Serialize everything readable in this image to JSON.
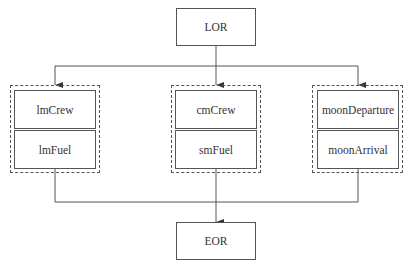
{
  "diagram": {
    "top_node": {
      "label": "LOR"
    },
    "bottom_node": {
      "label": "EOR"
    },
    "groups": [
      {
        "nodes": [
          {
            "label": "lmCrew"
          },
          {
            "label": "lmFuel"
          }
        ]
      },
      {
        "nodes": [
          {
            "label": "cmCrew"
          },
          {
            "label": "smFuel"
          }
        ]
      },
      {
        "nodes": [
          {
            "label": "moonDeparture"
          },
          {
            "label": "moonArrival"
          }
        ]
      }
    ],
    "edges": [
      {
        "from": "LOR",
        "to": "group-1"
      },
      {
        "from": "LOR",
        "to": "group-2"
      },
      {
        "from": "LOR",
        "to": "group-3"
      },
      {
        "from": "group-1",
        "to": "EOR"
      },
      {
        "from": "group-2",
        "to": "EOR"
      },
      {
        "from": "group-3",
        "to": "EOR"
      }
    ],
    "colors": {
      "line": "#555555",
      "background": "#ffffff"
    }
  }
}
